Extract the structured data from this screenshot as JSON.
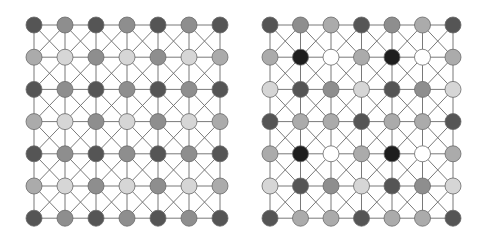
{
  "palette": {
    "K": "#1e1e1e",
    "D": "#555555",
    "M": "#8e8e8e",
    "L": "#ababab",
    "V": "#d6d6d6",
    "W": "#ffffff",
    "edge": "#6a6a6a",
    "stroke": "#6a6a6a"
  },
  "grids": [
    {
      "name": "left-grid",
      "x0": 34,
      "y0": 25,
      "dx": 31,
      "dy": 32.2,
      "rows": [
        [
          "D",
          "M",
          "D",
          "M",
          "D",
          "M",
          "D"
        ],
        [
          "L",
          "V",
          "M",
          "V",
          "M",
          "V",
          "L"
        ],
        [
          "D",
          "M",
          "D",
          "M",
          "D",
          "M",
          "D"
        ],
        [
          "L",
          "V",
          "M",
          "V",
          "M",
          "V",
          "L"
        ],
        [
          "D",
          "M",
          "D",
          "M",
          "D",
          "M",
          "D"
        ],
        [
          "L",
          "V",
          "M",
          "V",
          "M",
          "V",
          "L"
        ],
        [
          "D",
          "M",
          "D",
          "M",
          "D",
          "M",
          "D"
        ]
      ]
    },
    {
      "name": "right-grid",
      "x0": 270,
      "y0": 25,
      "dx": 30.5,
      "dy": 32.2,
      "rows": [
        [
          "D",
          "M",
          "L",
          "D",
          "M",
          "L",
          "D"
        ],
        [
          "L",
          "K",
          "W",
          "L",
          "K",
          "W",
          "L"
        ],
        [
          "V",
          "D",
          "M",
          "V",
          "D",
          "M",
          "V"
        ],
        [
          "D",
          "L",
          "L",
          "D",
          "L",
          "L",
          "D"
        ],
        [
          "L",
          "K",
          "W",
          "L",
          "K",
          "W",
          "L"
        ],
        [
          "V",
          "D",
          "M",
          "V",
          "D",
          "M",
          "V"
        ],
        [
          "D",
          "L",
          "L",
          "D",
          "L",
          "L",
          "D"
        ]
      ]
    }
  ],
  "node_radius": 8
}
